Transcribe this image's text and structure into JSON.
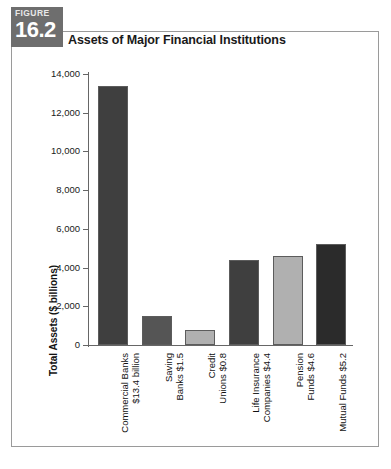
{
  "figure": {
    "badge_word": "FIGURE",
    "badge_number": "16.2",
    "title": "Assets of Major Financial Institutions"
  },
  "chart_data": {
    "type": "bar",
    "title": "Assets of Major Financial Institutions",
    "xlabel": "",
    "ylabel": "Total Assets ($ billions)",
    "ylim": [
      0,
      14000
    ],
    "yticks": [
      0,
      2000,
      4000,
      6000,
      8000,
      10000,
      12000,
      14000
    ],
    "ytick_labels": [
      "0",
      "2,000",
      "4,000",
      "6,000",
      "8,000",
      "10,000",
      "12,000",
      "14,000"
    ],
    "grid": false,
    "legend": "none",
    "categories": [
      "Commercial Banks\n$13.4 billion",
      "Saving\nBanks $1.5",
      "Credit\nUnions $0.8",
      "Life Insurance\nCompanies $4.4",
      "Pension\nFunds $4.6",
      "Mutual Funds $5.2"
    ],
    "values": [
      13400,
      1500,
      800,
      4400,
      4600,
      5200
    ],
    "bar_colors": [
      "#3f3f3f",
      "#555555",
      "#b0b0b0",
      "#3f3f3f",
      "#b0b0b0",
      "#2b2b2b"
    ]
  },
  "axis": {
    "y_title": "Total Assets ($ billions)",
    "ticks": [
      {
        "label": "14,000",
        "value": 14000
      },
      {
        "label": "12,000",
        "value": 12000
      },
      {
        "label": "10,000",
        "value": 10000
      },
      {
        "label": "8,000",
        "value": 8000
      },
      {
        "label": "6,000",
        "value": 6000
      },
      {
        "label": "4,000",
        "value": 4000
      },
      {
        "label": "2,000",
        "value": 2000
      },
      {
        "label": "0",
        "value": 0
      }
    ]
  },
  "bars": [
    {
      "label_line1": "Commercial Banks",
      "label_line2": "$13.4 billion",
      "value": 13400,
      "color": "#3f3f3f"
    },
    {
      "label_line1": "Saving",
      "label_line2": "Banks $1.5",
      "value": 1500,
      "color": "#555555"
    },
    {
      "label_line1": "Credit",
      "label_line2": "Unions $0.8",
      "value": 800,
      "color": "#b0b0b0"
    },
    {
      "label_line1": "Life Insurance",
      "label_line2": "Companies $4.4",
      "value": 4400,
      "color": "#3f3f3f"
    },
    {
      "label_line1": "Pension",
      "label_line2": "Funds $4.6",
      "value": 4600,
      "color": "#b0b0b0"
    },
    {
      "label_line1": "Mutual Funds $5.2",
      "label_line2": "",
      "value": 5200,
      "color": "#2b2b2b"
    }
  ]
}
